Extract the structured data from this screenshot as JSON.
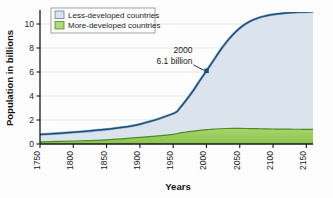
{
  "chart_data": {
    "type": "area",
    "title": "",
    "xlabel": "Years",
    "ylabel": "Population in billions",
    "xlim": [
      1750,
      2160
    ],
    "ylim": [
      0,
      11
    ],
    "grid": true,
    "legend_position": "top-left",
    "xticks": [
      "1750",
      "1800",
      "1850",
      "1900",
      "1950",
      "2000",
      "2050",
      "2100",
      "2150"
    ],
    "xtick_values": [
      1750,
      1800,
      1850,
      1900,
      1950,
      2000,
      2050,
      2100,
      2150
    ],
    "yticks": [
      "0",
      "2",
      "4",
      "6",
      "8",
      "10"
    ],
    "ytick_values": [
      0,
      2,
      4,
      6,
      8,
      10
    ],
    "x": [
      1750,
      1800,
      1850,
      1900,
      1950,
      1960,
      1970,
      1980,
      1990,
      2000,
      2010,
      2020,
      2030,
      2040,
      2050,
      2060,
      2070,
      2080,
      2090,
      2100,
      2110,
      2120,
      2130,
      2140,
      2150,
      2160
    ],
    "stacked": true,
    "series": [
      {
        "name": "More-developed countries",
        "color": "#9ccc5f",
        "line_color": "#4a8c23",
        "values": [
          0.17,
          0.25,
          0.35,
          0.55,
          0.81,
          0.92,
          1.0,
          1.08,
          1.14,
          1.19,
          1.24,
          1.27,
          1.29,
          1.3,
          1.3,
          1.29,
          1.28,
          1.27,
          1.26,
          1.25,
          1.24,
          1.24,
          1.23,
          1.23,
          1.22,
          1.22
        ]
      },
      {
        "name": "Less-developed countries",
        "color": "#dbe3ec",
        "line_color": "#1f4e79",
        "values": [
          0.62,
          0.73,
          0.87,
          1.1,
          1.72,
          2.08,
          2.69,
          3.36,
          4.14,
          4.91,
          5.67,
          6.48,
          7.2,
          7.83,
          8.35,
          8.76,
          9.06,
          9.28,
          9.43,
          9.54,
          9.62,
          9.68,
          9.73,
          9.76,
          9.79,
          9.8
        ]
      }
    ],
    "total_label": "Total world population",
    "total_values": [
      0.79,
      0.98,
      1.22,
      1.65,
      2.53,
      3.0,
      3.69,
      4.44,
      5.28,
      6.1,
      6.91,
      7.75,
      8.49,
      9.13,
      9.65,
      10.05,
      10.34,
      10.55,
      10.69,
      10.79,
      10.86,
      10.92,
      10.96,
      10.99,
      11.01,
      11.02
    ],
    "annotation": {
      "line1": "2000",
      "line2": "6.1 billion",
      "point_x": 2000,
      "point_y": 6.1,
      "marker_color": "#1f4e79"
    }
  },
  "legend": {
    "items": [
      {
        "label": "Less-developed countries",
        "swatch": "#dbe3ec",
        "border": "#5b7fa6"
      },
      {
        "label": "More-developed countries",
        "swatch": "#b2d97e",
        "border": "#4a8c23"
      }
    ]
  },
  "colors": {
    "axis": "#1a1a1a",
    "grid": "#d8d8d8",
    "background": "#fdfdfd",
    "less_developed_fill": "#dbe3ec",
    "more_developed_fill": "#9ccc5f",
    "total_line": "#1f4e79",
    "green_line": "#4a8c23"
  }
}
